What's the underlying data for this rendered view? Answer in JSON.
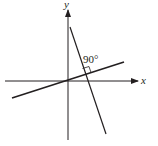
{
  "diagram": {
    "axes": {
      "x_label": "x",
      "y_label": "y"
    },
    "angle_label": "90°",
    "lines": [
      {
        "name": "shallow-line",
        "description": "line through origin with positive slope"
      },
      {
        "name": "steep-line",
        "description": "line with negative slope perpendicular to shallow line"
      }
    ],
    "colors": {
      "stroke": "#231f20",
      "background": "#ffffff"
    }
  }
}
